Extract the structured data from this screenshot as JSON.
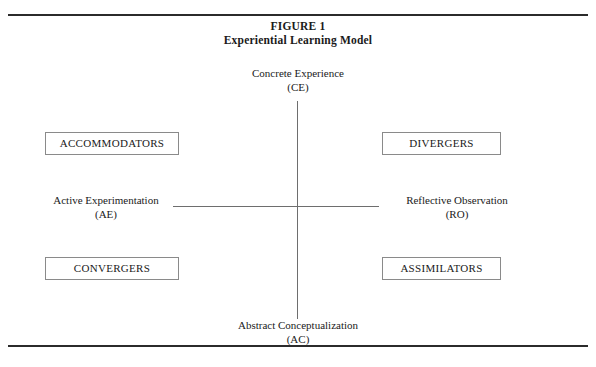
{
  "figure": {
    "caption_number": "FIGURE 1",
    "caption_title": "Experiential Learning Model"
  },
  "axes": {
    "top": {
      "name": "Concrete Experience",
      "abbr": "(CE)"
    },
    "bottom": {
      "name": "Abstract Conceptualization",
      "abbr": "(AC)"
    },
    "left": {
      "name": "Active Experimentation",
      "abbr": "(AE)"
    },
    "right": {
      "name": "Reflective Observation",
      "abbr": "(RO)"
    }
  },
  "learning_styles": {
    "top_left": "ACCOMMODATORS",
    "top_right": "DIVERGERS",
    "bottom_left": "CONVERGERS",
    "bottom_right": "ASSIMILATORS"
  },
  "colors": {
    "frame_rule": "#2b2b2b",
    "axis_line": "#6e6e6e",
    "box_border": "#8a8a8a",
    "text": "#1a1a1a",
    "background": "#ffffff"
  }
}
